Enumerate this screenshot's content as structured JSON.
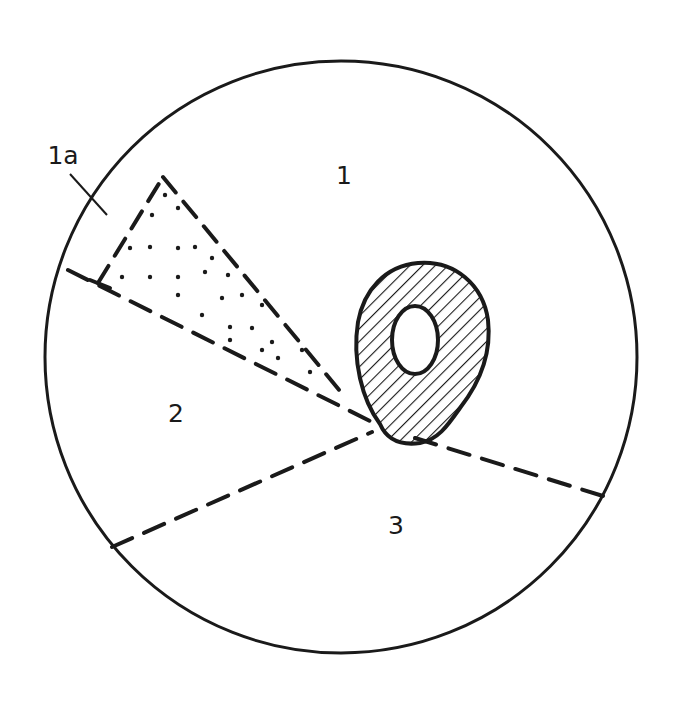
{
  "diagram": {
    "type": "circular-section-diagram",
    "canvas": {
      "width": 676,
      "height": 725,
      "background": "#ffffff"
    },
    "ink": "#1a1a1a",
    "outer_circle": {
      "cx": 341,
      "cy": 357,
      "r": 296,
      "stroke_width": 3
    },
    "labels": [
      {
        "id": "region-1",
        "text": "1",
        "x": 344,
        "y": 175
      },
      {
        "id": "region-1a",
        "text": "1a",
        "x": 63,
        "y": 155
      },
      {
        "id": "region-2",
        "text": "2",
        "x": 176,
        "y": 413
      },
      {
        "id": "region-3",
        "text": "3",
        "x": 396,
        "y": 525
      }
    ],
    "leader_line": {
      "x1": 70,
      "y1": 174,
      "x2": 107,
      "y2": 215
    },
    "dashed_boundaries": [
      {
        "id": "boundary-upper-left",
        "points": [
          [
            68,
            270
          ],
          [
            378,
            425
          ]
        ]
      },
      {
        "id": "boundary-lower-left",
        "points": [
          [
            112,
            547
          ],
          [
            372,
            432
          ]
        ]
      },
      {
        "id": "boundary-right",
        "points": [
          [
            415,
            438
          ],
          [
            603,
            496
          ]
        ]
      }
    ],
    "dash_pattern": "22 13",
    "dash_width": 4,
    "stippled_wedge": {
      "apex_left": [
        98,
        283
      ],
      "tip": [
        163,
        177
      ],
      "apex_right": [
        345,
        397
      ],
      "dots": [
        [
          165,
          195
        ],
        [
          152,
          215
        ],
        [
          178,
          208
        ],
        [
          130,
          248
        ],
        [
          150,
          247
        ],
        [
          178,
          248
        ],
        [
          195,
          247
        ],
        [
          212,
          258
        ],
        [
          122,
          277
        ],
        [
          150,
          277
        ],
        [
          178,
          277
        ],
        [
          205,
          272
        ],
        [
          228,
          275
        ],
        [
          178,
          295
        ],
        [
          222,
          298
        ],
        [
          242,
          295
        ],
        [
          262,
          305
        ],
        [
          202,
          315
        ],
        [
          230,
          327
        ],
        [
          252,
          328
        ],
        [
          272,
          342
        ],
        [
          230,
          340
        ],
        [
          262,
          350
        ],
        [
          302,
          350
        ],
        [
          310,
          372
        ],
        [
          278,
          358
        ]
      ]
    },
    "hatched_body": {
      "outer_path": "M 380 424 C 362 400, 352 360, 358 322 C 364 290, 385 266, 418 263 C 455 260, 483 285, 488 320 C 492 355, 478 385, 460 408 C 448 425, 438 440, 420 443 C 398 446, 386 438, 380 424 Z",
      "inner_hole": {
        "cx": 415,
        "cy": 340,
        "rx": 23,
        "ry": 34
      },
      "hatch_angle_deg": 45,
      "hatch_spacing": 9,
      "stroke_width": 4
    }
  }
}
